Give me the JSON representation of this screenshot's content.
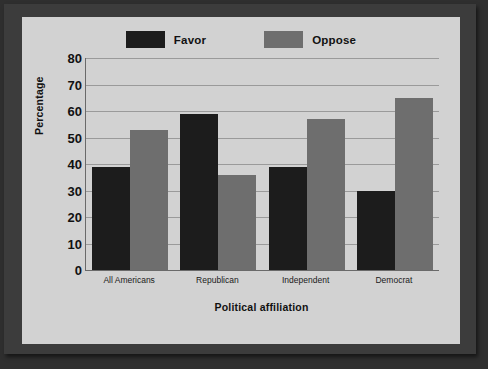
{
  "chart_data": {
    "type": "bar",
    "title": "",
    "xlabel": "Political affiliation",
    "ylabel": "Percentage",
    "categories": [
      "All Americans",
      "Republican",
      "Independent",
      "Democrat"
    ],
    "series": [
      {
        "name": "Favor",
        "color": "#1c1c1c",
        "values": [
          39,
          59,
          39,
          30
        ]
      },
      {
        "name": "Oppose",
        "color": "#6e6e6e",
        "values": [
          53,
          36,
          57,
          65
        ]
      }
    ],
    "ylim": [
      0,
      80
    ],
    "ytick_values": [
      0,
      10,
      20,
      30,
      40,
      50,
      60,
      70,
      80
    ],
    "ytick_labels": [
      "0",
      "10",
      "20",
      "30",
      "40",
      "50",
      "60",
      "70",
      "80"
    ],
    "grid": true,
    "legend_position": "top"
  },
  "legend": {
    "entries": [
      {
        "label": "Favor",
        "swatch": "favor-swatch"
      },
      {
        "label": "Oppose",
        "swatch": "oppose-swatch"
      }
    ]
  },
  "colors": {
    "favor": "#1c1c1c",
    "oppose": "#6e6e6e",
    "panel": "#d2d2d2",
    "frame": "#3c3c3c",
    "backdrop": "#2f2f2f",
    "gridline": "#9a9a9a",
    "axis": "#6a6a6a",
    "text": "#111111"
  }
}
